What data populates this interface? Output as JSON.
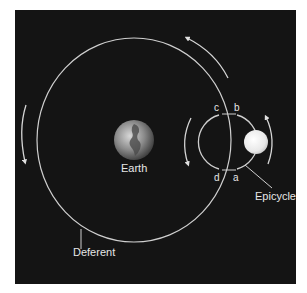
{
  "diagram": {
    "type": "geocentric-epicycle-model",
    "background": "#141414",
    "line_color": "#cfcfcf",
    "labels": {
      "earth": "Earth",
      "deferent": "Deferent",
      "epicycle": "Epicycle",
      "point_a": "a",
      "point_b": "b",
      "point_c": "c",
      "point_d": "d"
    },
    "elements": {
      "earth": {
        "cx": 134,
        "cy": 140,
        "r": 20
      },
      "deferent": {
        "cx": 134,
        "cy": 140,
        "rx": 97,
        "ry": 102
      },
      "epicycle": {
        "cx": 228,
        "cy": 142,
        "r": 28
      },
      "planet": {
        "cx": 256,
        "cy": 142,
        "r": 12,
        "color": "#f2f2f2"
      }
    },
    "arrows": [
      {
        "name": "deferent-motion-top",
        "direction": "counterclockwise"
      },
      {
        "name": "deferent-motion-left",
        "direction": "counterclockwise"
      },
      {
        "name": "epicycle-motion-left",
        "direction": "counterclockwise"
      },
      {
        "name": "epicycle-motion-right",
        "direction": "counterclockwise"
      }
    ]
  }
}
